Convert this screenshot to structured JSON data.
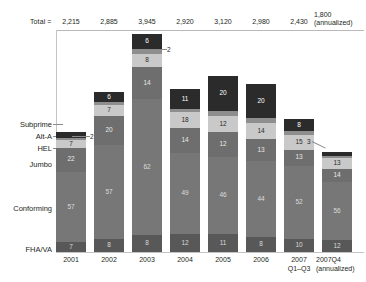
{
  "chart_data": {
    "type": "bar",
    "title": "",
    "xlabel": "",
    "ylabel": "",
    "stacked": true,
    "grid": false,
    "legend_position": "left-axis-labels",
    "total_label": "Total =",
    "categories": [
      "2001",
      "2002",
      "2003",
      "2004",
      "2005",
      "2006",
      "2007 Q1–Q3",
      "2007Q4 (annualized)"
    ],
    "totals": [
      "2,215",
      "2,885",
      "3,945",
      "2,920",
      "3,120",
      "2,980",
      "2,430",
      "1,800"
    ],
    "totals_note": "(annualized)",
    "series": [
      {
        "name": "Subprime",
        "values": [
          5,
          6,
          6,
          11,
          20,
          20,
          8,
          3
        ]
      },
      {
        "name": "Alt-A",
        "values": [
          2,
          2,
          2,
          2,
          2,
          2,
          2,
          2
        ]
      },
      {
        "name": "HEL",
        "values": [
          7,
          7,
          8,
          8,
          9,
          12,
          15,
          13
        ]
      },
      {
        "name": "Jumbo",
        "values": [
          22,
          20,
          14,
          18,
          12,
          14,
          13,
          14
        ]
      },
      {
        "name": "Conforming",
        "values": [
          57,
          57,
          62,
          49,
          46,
          44,
          52,
          56
        ]
      },
      {
        "name": "FHA/VA",
        "values": [
          7,
          8,
          8,
          12,
          11,
          8,
          10,
          12
        ]
      }
    ],
    "bars": [
      {
        "category": "2001",
        "total": "2,215",
        "segments": [
          {
            "name": "Subprime",
            "label": "5",
            "pct": 5
          },
          {
            "name": "Alt-A",
            "label": "2",
            "pct": 2
          },
          {
            "name": "HEL",
            "label": "7",
            "pct": 6
          },
          {
            "name": "Jumbo",
            "label": "22",
            "pct": 20
          },
          {
            "name": "Conforming",
            "label": "57",
            "pct": 59
          },
          {
            "name": "FHA/VA",
            "label": "7",
            "pct": 8
          }
        ]
      },
      {
        "category": "2002",
        "total": "2,885",
        "segments": [
          {
            "name": "Subprime",
            "label": "6",
            "pct": 6
          },
          {
            "name": "Alt-A",
            "label": "2",
            "pct": 2
          },
          {
            "name": "HEL",
            "label": "7",
            "pct": 7
          },
          {
            "name": "Jumbo",
            "label": "20",
            "pct": 18
          },
          {
            "name": "Conforming",
            "label": "57",
            "pct": 59
          },
          {
            "name": "FHA/VA",
            "label": "8",
            "pct": 8
          }
        ]
      },
      {
        "category": "2003",
        "total": "3,945",
        "segments": [
          {
            "name": "Subprime",
            "label": "6",
            "pct": 7
          },
          {
            "name": "Alt-A",
            "label": "2",
            "pct": 2
          },
          {
            "name": "HEL",
            "label": "8",
            "pct": 6
          },
          {
            "name": "Jumbo",
            "label": "14",
            "pct": 15
          },
          {
            "name": "Conforming",
            "label": "62",
            "pct": 62
          },
          {
            "name": "FHA/VA",
            "label": "8",
            "pct": 8
          }
        ]
      },
      {
        "category": "2004",
        "total": "2,920",
        "segments": [
          {
            "name": "Subprime",
            "label": "11",
            "pct": 12
          },
          {
            "name": "Alt-A",
            "label": "2",
            "pct": 2
          },
          {
            "name": "HEL",
            "label": "18",
            "pct": 10
          },
          {
            "name": "Jumbo",
            "label": "14",
            "pct": 15
          },
          {
            "name": "Conforming",
            "label": "49",
            "pct": 50
          },
          {
            "name": "FHA/VA",
            "label": "12",
            "pct": 11
          }
        ]
      },
      {
        "category": "2005",
        "total": "3,120",
        "segments": [
          {
            "name": "Subprime",
            "label": "20",
            "pct": 20
          },
          {
            "name": "Alt-A",
            "label": "2",
            "pct": 3
          },
          {
            "name": "HEL",
            "label": "12",
            "pct": 9
          },
          {
            "name": "Jumbo",
            "label": "12",
            "pct": 14
          },
          {
            "name": "Conforming",
            "label": "46",
            "pct": 44
          },
          {
            "name": "FHA/VA",
            "label": "11",
            "pct": 10
          }
        ]
      },
      {
        "category": "2006",
        "total": "2,980",
        "segments": [
          {
            "name": "Subprime",
            "label": "20",
            "pct": 20
          },
          {
            "name": "Alt-A",
            "label": "2",
            "pct": 3
          },
          {
            "name": "HEL",
            "label": "14",
            "pct": 10
          },
          {
            "name": "Jumbo",
            "label": "13",
            "pct": 13
          },
          {
            "name": "Conforming",
            "label": "44",
            "pct": 45
          },
          {
            "name": "FHA/VA",
            "label": "8",
            "pct": 9
          }
        ]
      },
      {
        "category": "2007 Q1–Q3",
        "total": "2,430",
        "segments": [
          {
            "name": "Subprime",
            "label": "8",
            "pct": 9
          },
          {
            "name": "Alt-A",
            "label": "2",
            "pct": 3
          },
          {
            "name": "HEL",
            "label": "15",
            "pct": 11
          },
          {
            "name": "Jumbo",
            "label": "13",
            "pct": 12
          },
          {
            "name": "Conforming",
            "label": "52",
            "pct": 55
          },
          {
            "name": "FHA/VA",
            "label": "10",
            "pct": 10
          }
        ]
      },
      {
        "category": "2007Q4 (annualized)",
        "total": "1,800",
        "segments": [
          {
            "name": "Subprime",
            "label": "3",
            "pct": 4
          },
          {
            "name": "Alt-A",
            "label": "2",
            "pct": 2
          },
          {
            "name": "HEL",
            "label": "13",
            "pct": 11
          },
          {
            "name": "Jumbo",
            "label": "14",
            "pct": 13
          },
          {
            "name": "Conforming",
            "label": "56",
            "pct": 58
          },
          {
            "name": "FHA/VA",
            "label": "12",
            "pct": 12
          }
        ]
      }
    ],
    "category_labels": [
      "Subprime",
      "Alt-A",
      "HEL",
      "Jumbo",
      "Conforming",
      "FHA/VA"
    ],
    "callouts": [
      {
        "text": "2",
        "for": "2001"
      },
      {
        "text": "2",
        "for": "2003"
      },
      {
        "text": "3",
        "for": "2007Q4"
      }
    ],
    "colors": {
      "subprime": "#2b2b2b",
      "alt_a": "#8e8e8e",
      "hel": "#c9c9c9",
      "jumbo": "#6e6e6e",
      "conforming": "#777777",
      "fha_va": "#585858",
      "axis": "#c4c4c4",
      "text": "#231f20"
    }
  },
  "xlabels": [
    {
      "line1": "2001",
      "line2": ""
    },
    {
      "line1": "2002",
      "line2": ""
    },
    {
      "line1": "2003",
      "line2": ""
    },
    {
      "line1": "2004",
      "line2": ""
    },
    {
      "line1": "2005",
      "line2": ""
    },
    {
      "line1": "2006",
      "line2": ""
    },
    {
      "line1": "2007",
      "line2": "Q1–Q3"
    },
    {
      "line1": "2007Q4",
      "line2": "(annualized)"
    }
  ],
  "totals_row": {
    "label": "Total =",
    "values": [
      "2,215",
      "2,885",
      "3,945",
      "2,920",
      "3,120",
      "2,980",
      "2,430"
    ],
    "last_value_line1": "1,800",
    "last_value_line2": "(annualized)"
  },
  "left_labels": [
    "Subprime",
    "Alt-A",
    "HEL",
    "Jumbo",
    "Conforming",
    "FHA/VA"
  ],
  "callout_labels": [
    "2",
    "2",
    "3"
  ]
}
